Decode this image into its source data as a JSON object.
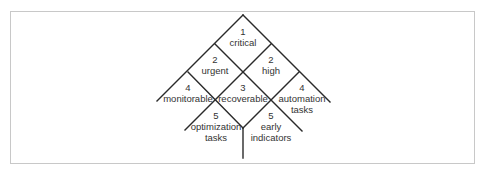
{
  "diagram": {
    "type": "priority-tree",
    "line_color": "#2a2a2a",
    "frame_color": "#c8c8c8",
    "cells": [
      {
        "id": "critical",
        "priority": "1",
        "lines": [
          "critical"
        ]
      },
      {
        "id": "urgent",
        "priority": "2",
        "lines": [
          "urgent"
        ]
      },
      {
        "id": "high",
        "priority": "2",
        "lines": [
          "high"
        ]
      },
      {
        "id": "monitorable",
        "priority": "4",
        "lines": [
          "monitorable"
        ]
      },
      {
        "id": "recoverable",
        "priority": "3",
        "lines": [
          "recoverable"
        ]
      },
      {
        "id": "automation-tasks",
        "priority": "4",
        "lines": [
          "automation",
          "tasks"
        ]
      },
      {
        "id": "optimization-tasks",
        "priority": "5",
        "lines": [
          "optimization",
          "tasks"
        ]
      },
      {
        "id": "early-indicators",
        "priority": "5",
        "lines": [
          "early",
          "indicators"
        ]
      }
    ]
  }
}
